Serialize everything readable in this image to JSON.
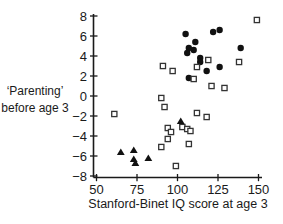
{
  "figure": {
    "ylabel_line1": "‘Parenting’",
    "ylabel_line2": "before age 3",
    "xlabel": "Stanford-Binet IQ score at age 3"
  },
  "chart_data": {
    "type": "scatter",
    "title": "",
    "xlabel": "Stanford-Binet IQ score at age 3",
    "ylabel": "‘Parenting’ before age 3",
    "xlim": [
      50,
      150
    ],
    "ylim": [
      -8,
      8
    ],
    "x_ticks": [
      50,
      75,
      100,
      125,
      150
    ],
    "x_tick_labels": [
      "50",
      "75",
      "100",
      "125",
      "150"
    ],
    "y_ticks": [
      8,
      6,
      4,
      2,
      0,
      -2,
      -4,
      -6,
      -8
    ],
    "y_tick_labels": [
      "8",
      "6",
      "4",
      "2",
      "0",
      "−2",
      "−4",
      "−6",
      "−8"
    ],
    "grid": false,
    "legend": "none",
    "marker_colors": {
      "point": "#111111",
      "square_stroke": "#333333"
    },
    "series": [
      {
        "name": "filled-circles",
        "marker": "filled-circle",
        "points": [
          [
            105,
            6.2
          ],
          [
            122,
            6.4
          ],
          [
            126,
            6.6
          ],
          [
            111,
            5.4
          ],
          [
            107,
            4.8
          ],
          [
            110,
            4.6
          ],
          [
            106,
            4.3
          ],
          [
            114,
            3.8
          ],
          [
            114,
            3.4
          ],
          [
            139,
            4.8
          ],
          [
            126,
            2.9
          ],
          [
            118,
            2.5
          ],
          [
            107,
            1.8
          ]
        ]
      },
      {
        "name": "open-squares",
        "marker": "open-square",
        "points": [
          [
            149,
            7.6
          ],
          [
            91,
            3.0
          ],
          [
            97,
            2.5
          ],
          [
            112,
            2.9
          ],
          [
            119,
            3.6
          ],
          [
            138,
            3.4
          ],
          [
            110,
            1.7
          ],
          [
            121,
            1.0
          ],
          [
            129,
            0.8
          ],
          [
            90,
            -0.2
          ],
          [
            92,
            -1.1
          ],
          [
            61,
            -1.8
          ],
          [
            112,
            -1.7
          ],
          [
            118,
            -2.1
          ],
          [
            94,
            -3.2
          ],
          [
            96,
            -3.6
          ],
          [
            103,
            -3.1
          ],
          [
            106,
            -3.3
          ],
          [
            108,
            -3.5
          ],
          [
            94,
            -4.3
          ],
          [
            90,
            -5.1
          ],
          [
            107,
            -4.8
          ],
          [
            99,
            -7.0
          ]
        ]
      },
      {
        "name": "filled-triangles",
        "marker": "filled-triangle",
        "points": [
          [
            65,
            -5.6
          ],
          [
            73,
            -5.4
          ],
          [
            73,
            -6.3
          ],
          [
            74,
            -6.7
          ],
          [
            82,
            -6.2
          ],
          [
            102,
            -2.5
          ]
        ]
      }
    ]
  }
}
